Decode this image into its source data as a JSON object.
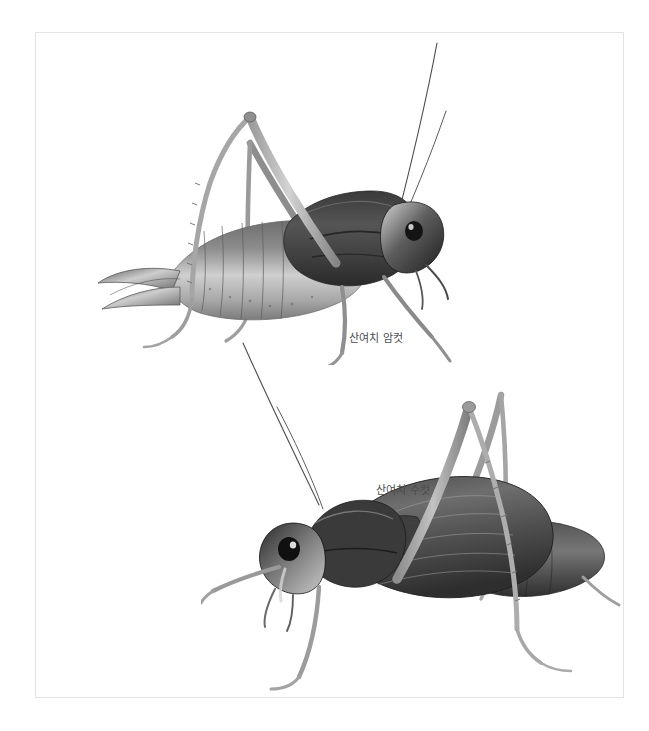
{
  "page": {
    "background_color": "#ffffff",
    "width": 649,
    "height": 731
  },
  "plate": {
    "border_color": "#e3e3e3",
    "background_color": "#ffffff"
  },
  "captions": {
    "female": "산여치 암컷",
    "male": "산여치 수컷",
    "text_color": "#4c4c4c"
  },
  "specimens": [
    {
      "id": "female",
      "label": "산여치 암컷",
      "orientation": "facing-right",
      "features": [
        "long curved ovipositor",
        "long hind legs",
        "two long antennae"
      ],
      "tone": "grayscale"
    },
    {
      "id": "male",
      "label": "산여치 수컷",
      "orientation": "facing-left",
      "features": [
        "broad tegmina",
        "long hind legs",
        "two long antennae"
      ],
      "tone": "grayscale"
    }
  ]
}
